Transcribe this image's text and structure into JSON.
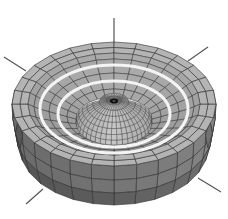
{
  "figure": {
    "width": 228,
    "height": 219,
    "background": "#ffffff",
    "center": [
      114,
      104
    ],
    "colors": {
      "rim_top": "#b4b4b4",
      "inner_floor": "#a8a8a8",
      "outer_wall": "#7c7c7c",
      "outer_wall_dark": "#6a6a6a",
      "grid_line": "#2f2f2f",
      "ring_band": "#f4f4f4",
      "dome": "#c4c4c4",
      "dome_grid": "#3a3a3a",
      "apex": "#111111",
      "axis_line": "#555555"
    },
    "rim": {
      "rx": 102,
      "ry": 62,
      "inner_rx": 86,
      "inner_ry": 51
    },
    "wall": {
      "depth": 44
    },
    "floor_rings": [
      {
        "rx": 74,
        "ry": 44,
        "band": true
      },
      {
        "rx": 56,
        "ry": 33,
        "band": true
      }
    ],
    "dome": {
      "base_rx": 38,
      "base_ry": 22,
      "base_y": 130,
      "apex_y": 100
    },
    "axis_lines": [
      {
        "name": "z-axis-top",
        "x1": 114,
        "y1": 18,
        "x2": 114,
        "y2": 44
      },
      {
        "name": "axis-upper-left",
        "x1": 4,
        "y1": 57,
        "x2": 26,
        "y2": 71
      },
      {
        "name": "axis-upper-right",
        "x1": 208,
        "y1": 47,
        "x2": 188,
        "y2": 61
      },
      {
        "name": "axis-lower-left",
        "x1": 26,
        "y1": 204,
        "x2": 43,
        "y2": 189
      },
      {
        "name": "axis-lower-right",
        "x1": 221,
        "y1": 192,
        "x2": 198,
        "y2": 178
      }
    ],
    "mesh": {
      "angular_segments": 28,
      "wall_bands": 3,
      "floor_bands": 4,
      "dome_bands": 8
    }
  }
}
